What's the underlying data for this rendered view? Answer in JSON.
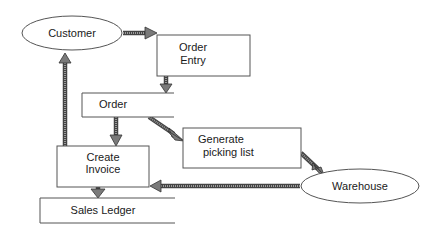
{
  "diagram": {
    "type": "data-flow-diagram",
    "nodes": [
      {
        "id": "customer",
        "kind": "external-entity",
        "shape": "ellipse",
        "label": "Customer"
      },
      {
        "id": "order_entry",
        "kind": "process",
        "shape": "rectangle",
        "label_line1": "Order",
        "label_line2": "Entry"
      },
      {
        "id": "order",
        "kind": "data-store",
        "shape": "open-rectangle",
        "label": "Order"
      },
      {
        "id": "generate_picking_list",
        "kind": "process",
        "shape": "rectangle",
        "label_line1": "Generate",
        "label_line2": "picking list"
      },
      {
        "id": "create_invoice",
        "kind": "process",
        "shape": "rectangle",
        "label_line1": "Create",
        "label_line2": "Invoice"
      },
      {
        "id": "warehouse",
        "kind": "external-entity",
        "shape": "ellipse",
        "label": "Warehouse"
      },
      {
        "id": "sales_ledger",
        "kind": "data-store",
        "shape": "open-rectangle",
        "label": "Sales Ledger"
      }
    ],
    "edges": [
      {
        "from": "customer",
        "to": "order_entry"
      },
      {
        "from": "order_entry",
        "to": "order"
      },
      {
        "from": "order",
        "to": "create_invoice"
      },
      {
        "from": "order",
        "to": "generate_picking_list"
      },
      {
        "from": "generate_picking_list",
        "to": "warehouse"
      },
      {
        "from": "warehouse",
        "to": "create_invoice"
      },
      {
        "from": "create_invoice",
        "to": "customer"
      },
      {
        "from": "create_invoice",
        "to": "sales_ledger"
      }
    ]
  },
  "labels": {
    "customer": "Customer",
    "order_entry_1": "Order",
    "order_entry_2": "Entry",
    "order_store": "Order",
    "picking_1": "Generate",
    "picking_2": "picking list",
    "invoice_1": "Create",
    "invoice_2": "Invoice",
    "warehouse": "Warehouse",
    "sales_ledger": "Sales Ledger"
  },
  "colors": {
    "stroke": "#555555",
    "arrow_fill": "#7a7a7a",
    "background": "#ffffff",
    "text": "#1a1a1a"
  }
}
